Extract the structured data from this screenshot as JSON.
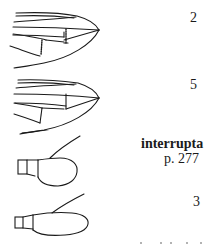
{
  "key": {
    "couplets": [
      {
        "number": "2"
      },
      {
        "number": "5"
      },
      {
        "number": "3"
      }
    ],
    "species": {
      "name": "interrupta",
      "page_ref": "p. 277"
    }
  },
  "figures": [
    {
      "name": "elytral-apex-with-dotted-veins"
    },
    {
      "name": "elytral-apex-plain"
    },
    {
      "name": "antennal-club-oval"
    },
    {
      "name": "antennal-club-elongate"
    }
  ],
  "colors": {
    "ink": "#1a1a1a",
    "paper": "#ffffff"
  }
}
